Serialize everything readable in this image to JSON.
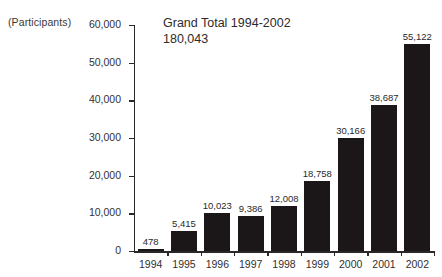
{
  "axis_unit_caption": "(Participants)",
  "title": {
    "line1": "Grand Total 1994-2002",
    "line2": "180,043"
  },
  "colors": {
    "bar": "#1b1718",
    "axis": "#2b2829",
    "text": "#332f30",
    "background": "#ffffff"
  },
  "chart_data": {
    "type": "bar",
    "title": "Grand Total 1994-2002 180,043",
    "xlabel": "",
    "ylabel": "(Participants)",
    "categories": [
      "1994",
      "1995",
      "1996",
      "1997",
      "1998",
      "1999",
      "2000",
      "2001",
      "2002"
    ],
    "values": [
      478,
      5415,
      10023,
      9386,
      12008,
      18758,
      30166,
      38687,
      55122
    ],
    "value_labels": [
      "478",
      "5,415",
      "10,023",
      "9,386",
      "12,008",
      "18,758",
      "30,166",
      "38,687",
      "55,122"
    ],
    "ylim": [
      0,
      60000
    ],
    "ytick_values": [
      0,
      10000,
      20000,
      30000,
      40000,
      50000,
      60000
    ],
    "ytick_labels": [
      "0",
      "10,000",
      "20,000",
      "30,000",
      "40,000",
      "50,000",
      "60,000"
    ],
    "grid": false,
    "legend": false,
    "total": 180043
  }
}
